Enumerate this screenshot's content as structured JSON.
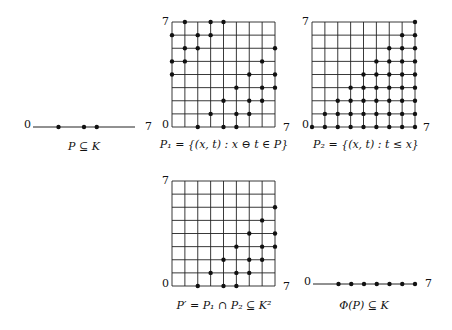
{
  "colors": {
    "ink": "#111111",
    "background": "#ffffff"
  },
  "universe": {
    "size": 9,
    "min_label": "0",
    "max_label": "7"
  },
  "panels": [
    {
      "id": "P",
      "kind": "line",
      "caption": "P ⊆ K",
      "x0": 33,
      "x1": 135,
      "y": 127,
      "label_left": "0",
      "label_right": "7",
      "caption_x": 84,
      "caption_y": 150,
      "points": [
        2,
        4,
        5
      ]
    },
    {
      "id": "P1",
      "kind": "grid",
      "caption": "P₁ = {(x, t) : x ⊖ t ∈ P}",
      "x0": 172,
      "y0": 22,
      "x1": 275,
      "y1": 127,
      "label_top": "7",
      "label_origin": "0",
      "label_right": "7",
      "caption_x": 224,
      "caption_y": 148,
      "points": [
        [
          2,
          0
        ],
        [
          4,
          0
        ],
        [
          5,
          0
        ],
        [
          3,
          1
        ],
        [
          5,
          1
        ],
        [
          6,
          1
        ],
        [
          4,
          2
        ],
        [
          6,
          2
        ],
        [
          7,
          2
        ],
        [
          5,
          3
        ],
        [
          7,
          3
        ],
        [
          8,
          3
        ],
        [
          6,
          4
        ],
        [
          8,
          4
        ],
        [
          0,
          4
        ],
        [
          7,
          5
        ],
        [
          0,
          5
        ],
        [
          1,
          5
        ],
        [
          8,
          6
        ],
        [
          1,
          6
        ],
        [
          2,
          6
        ],
        [
          0,
          7
        ],
        [
          2,
          7
        ],
        [
          3,
          7
        ],
        [
          1,
          8
        ],
        [
          3,
          8
        ],
        [
          4,
          8
        ]
      ]
    },
    {
      "id": "P2",
      "kind": "grid",
      "caption": "P₂ = {(x, t) : t ≤ x}",
      "x0": 312,
      "y0": 22,
      "x1": 415,
      "y1": 127,
      "label_top": "7",
      "label_origin": "0",
      "label_right": "7",
      "caption_x": 366,
      "caption_y": 148,
      "rule": "t<=x"
    },
    {
      "id": "Pprime",
      "kind": "grid",
      "caption": "P′ = P₁ ∩ P₂ ⊆ K²",
      "x0": 172,
      "y0": 181,
      "x1": 275,
      "y1": 286,
      "label_top": "7",
      "label_origin": "0",
      "label_right": "7",
      "caption_x": 224,
      "caption_y": 309,
      "points": [
        [
          2,
          0
        ],
        [
          4,
          0
        ],
        [
          5,
          0
        ],
        [
          3,
          1
        ],
        [
          5,
          1
        ],
        [
          6,
          1
        ],
        [
          4,
          2
        ],
        [
          6,
          2
        ],
        [
          7,
          2
        ],
        [
          5,
          3
        ],
        [
          7,
          3
        ],
        [
          8,
          3
        ],
        [
          6,
          4
        ],
        [
          8,
          4
        ],
        [
          7,
          5
        ],
        [
          8,
          6
        ]
      ]
    },
    {
      "id": "Phi",
      "kind": "line",
      "caption": "Φ(P) ⊆ K",
      "x0": 313,
      "x1": 415,
      "y": 284,
      "label_left": "0",
      "label_right": "7",
      "caption_x": 364,
      "caption_y": 309,
      "points": [
        2,
        3,
        4,
        5,
        6,
        7,
        8
      ]
    }
  ]
}
